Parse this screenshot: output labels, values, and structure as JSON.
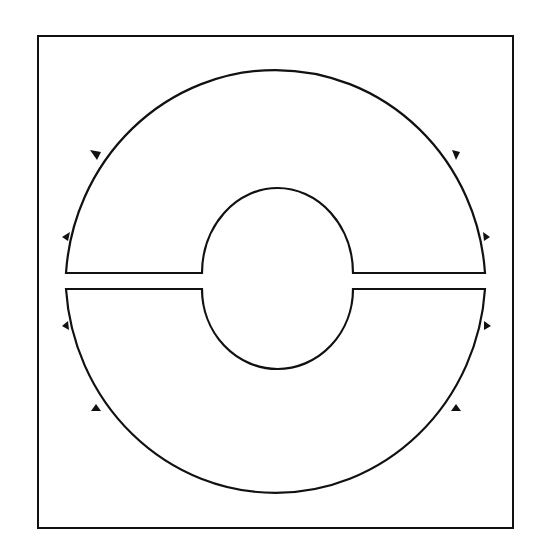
{
  "diagram": {
    "type": "contour-diagram",
    "colors": {
      "stroke": "#111111",
      "background": "#ffffff"
    },
    "frame": {
      "x": 38,
      "y": 36,
      "width": 475,
      "height": 492
    },
    "upper_contour": {
      "outer_radius": 218,
      "inner_radius": 75,
      "cut_y": 273,
      "arrow_count": 4
    },
    "lower_contour": {
      "outer_radius": 218,
      "inner_radius": 75,
      "cut_y": 289,
      "arrow_count": 4
    }
  }
}
